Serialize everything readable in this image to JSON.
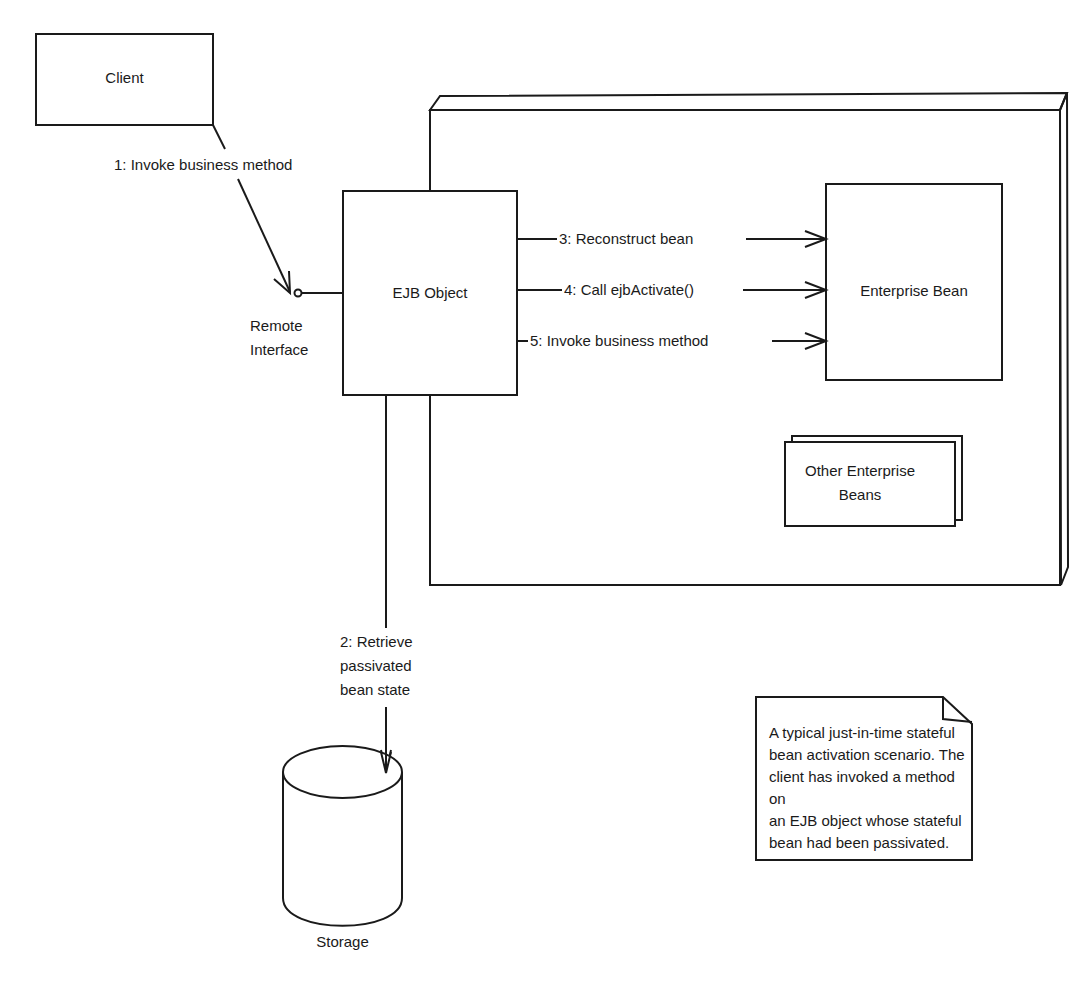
{
  "diagram": {
    "type": "UML collaboration diagram",
    "nodes": {
      "client": {
        "label": "Client"
      },
      "ejb_object": {
        "label": "EJB Object"
      },
      "remote_interface": {
        "label_line1": "Remote",
        "label_line2": "Interface"
      },
      "container": {
        "label": ""
      },
      "enterprise_bean": {
        "label": "Enterprise Bean"
      },
      "other_beans": {
        "label_line1": "Other Enterprise",
        "label_line2": "Beans"
      },
      "storage": {
        "label": "Storage"
      }
    },
    "messages": [
      {
        "step": 1,
        "label": "1: Invoke business method"
      },
      {
        "step": 2,
        "label_line1": "2: Retrieve",
        "label_line2": "passivated",
        "label_line3": "bean state"
      },
      {
        "step": 3,
        "label": "3: Reconstruct bean"
      },
      {
        "step": 4,
        "label": "4: Call ejbActivate()"
      },
      {
        "step": 5,
        "label": "5: Invoke business method"
      }
    ],
    "note": {
      "text": "A typical just-in-time stateful\nbean activation scenario.  The\nclient has invoked a method on\nan EJB object whose stateful\nbean had been passivated."
    },
    "colors": {
      "stroke": "#1a1a1a",
      "background": "#ffffff"
    }
  }
}
